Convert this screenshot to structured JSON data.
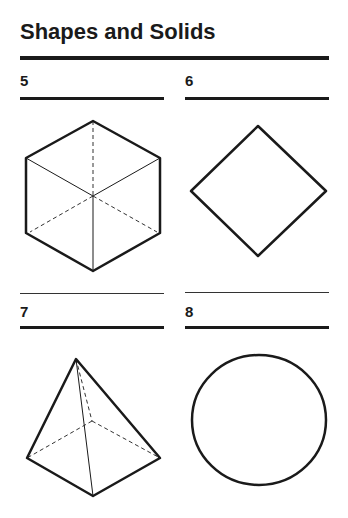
{
  "title": "Shapes and Solids",
  "items": [
    {
      "number": "5",
      "shape": "cube-icon"
    },
    {
      "number": "6",
      "shape": "square-icon"
    },
    {
      "number": "7",
      "shape": "square-pyramid-icon"
    },
    {
      "number": "8",
      "shape": "circle-icon"
    }
  ],
  "colors": {
    "ink": "#1a1a1a",
    "background": "#ffffff"
  }
}
